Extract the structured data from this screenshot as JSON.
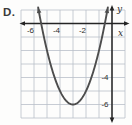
{
  "choice_label": "D.",
  "colors": {
    "grid": "#b9bfc9",
    "axis": "#242424",
    "curve": "#4d4d4d",
    "text": "#2e2e2e",
    "background": "#fdfdfc"
  },
  "chart_data": {
    "type": "line",
    "xlabel": "x",
    "ylabel": "y",
    "xlim": [
      -7,
      1
    ],
    "ylim": [
      -7,
      1
    ],
    "grid": true,
    "axis_arrows": "both-ends",
    "x_ticks": [
      {
        "value": -6,
        "label": "-6"
      },
      {
        "value": -4,
        "label": "-4"
      },
      {
        "value": -2,
        "label": "-2"
      }
    ],
    "y_ticks": [
      {
        "value": -4,
        "label": "-4"
      },
      {
        "value": -6,
        "label": "-6"
      }
    ],
    "series": [
      {
        "name": "parabola",
        "equation": "y = (x + 3)^2 - 6",
        "coeffs": {
          "a": 1,
          "h": -3,
          "k": -6
        },
        "vertex": [
          -3,
          -6
        ],
        "x_intercepts": [
          -5.45,
          -0.55
        ],
        "draw_x_range": [
          -5.68,
          -0.32
        ],
        "end_arrows": true,
        "points": [
          [
            -5.6,
            0.76
          ],
          [
            -5.0,
            -2.0
          ],
          [
            -4.5,
            -3.75
          ],
          [
            -4.0,
            -5.0
          ],
          [
            -3.5,
            -5.75
          ],
          [
            -3.0,
            -6.0
          ],
          [
            -2.5,
            -5.75
          ],
          [
            -2.0,
            -5.0
          ],
          [
            -1.5,
            -3.75
          ],
          [
            -1.0,
            -2.0
          ],
          [
            -0.4,
            0.76
          ]
        ]
      }
    ]
  }
}
